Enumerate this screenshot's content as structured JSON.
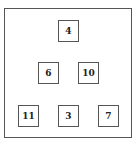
{
  "diagram": {
    "type": "tree",
    "nodes": [
      {
        "id": "n0",
        "label": "4",
        "row": 0
      },
      {
        "id": "n1",
        "label": "6",
        "row": 1
      },
      {
        "id": "n2",
        "label": "10",
        "row": 1
      },
      {
        "id": "n3",
        "label": "11",
        "row": 2
      },
      {
        "id": "n4",
        "label": "3",
        "row": 2
      },
      {
        "id": "n5",
        "label": "7",
        "row": 2
      }
    ],
    "colors": {
      "border": "#555555",
      "background": "#ffffff",
      "text": "#222222"
    }
  }
}
